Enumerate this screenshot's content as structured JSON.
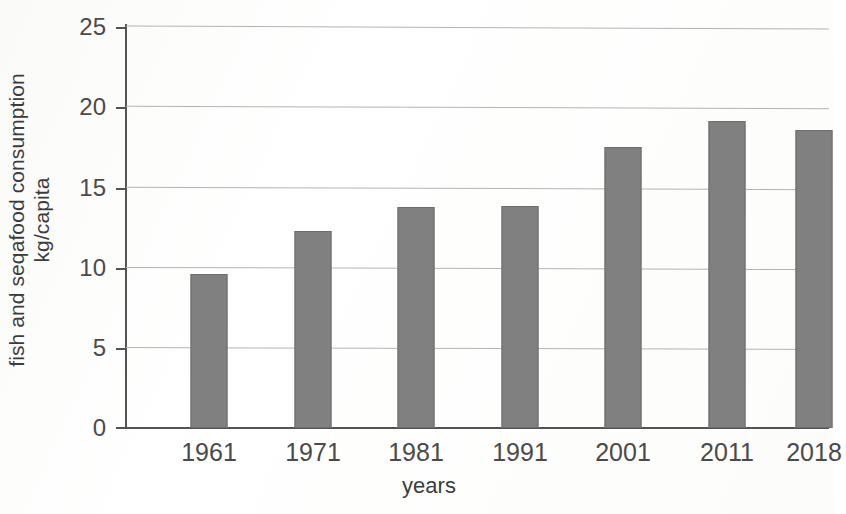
{
  "chart_data": {
    "type": "bar",
    "title": "",
    "subtitle": "",
    "xlabel": "years",
    "ylabel_line1": "fish and seqafood consumption",
    "ylabel_line2": "kg/capita",
    "categories": [
      "1961",
      "1971",
      "1981",
      "1991",
      "2001",
      "2011",
      "2018"
    ],
    "values": [
      9.6,
      12.3,
      13.75,
      13.85,
      17.5,
      19.15,
      18.6
    ],
    "yticks": [
      "25",
      "20",
      "15",
      "10",
      "5",
      "0"
    ],
    "ylim": [
      0,
      25
    ],
    "ytick_step": 5,
    "grid": true,
    "grid_axis": "y",
    "legend": "none",
    "bar_color": "#808080",
    "bar_edge_color": "#6d6d6d",
    "axis_color": "#545454",
    "grid_color": "#b4b4b4",
    "background": "#ffffff",
    "annotations": []
  },
  "axes": {
    "y_title_line1": "fish and seqafood consumption",
    "y_title_line2": "kg/capita",
    "x_title": "years"
  }
}
